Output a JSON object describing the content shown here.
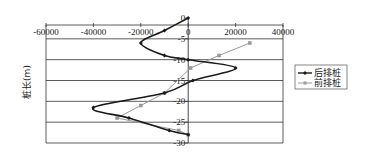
{
  "chart_data": {
    "type": "line",
    "title": "",
    "xlabel": "",
    "ylabel": "桩长(m)",
    "xlim": [
      -60000,
      40000
    ],
    "ylim": [
      -30,
      0
    ],
    "xticks": [
      -60000,
      -40000,
      -20000,
      0,
      20000,
      40000
    ],
    "xtick_labels": [
      "-60000",
      "-40000",
      "-20000",
      "0",
      "20000",
      "40000"
    ],
    "yticks": [
      0,
      -5,
      -10,
      -15,
      -20,
      -25,
      -30
    ],
    "ytick_labels": [
      "0",
      "-5",
      "-10",
      "-15",
      "-20",
      "-25",
      "-30"
    ],
    "grid": "horizontal",
    "legend_position": "right",
    "series": [
      {
        "name": "后排桩",
        "color": "#1a1a1a",
        "marker": "diamond",
        "smooth": true,
        "points": [
          [
            0,
            0
          ],
          [
            -10000,
            -3
          ],
          [
            -20000,
            -6
          ],
          [
            -10000,
            -9
          ],
          [
            0,
            -10
          ],
          [
            20000,
            -12
          ],
          [
            2000,
            -15
          ],
          [
            -10000,
            -18
          ],
          [
            -40000,
            -21.5
          ],
          [
            -25000,
            -24
          ],
          [
            -8000,
            -27
          ],
          [
            0,
            -28
          ]
        ]
      },
      {
        "name": "前排桩",
        "color": "#999999",
        "marker": "square",
        "smooth": false,
        "points": [
          [
            26000,
            -6
          ],
          [
            13000,
            -9
          ],
          [
            1000,
            -12
          ],
          [
            -10000,
            -18
          ],
          [
            -20000,
            -21
          ],
          [
            -30000,
            -24
          ],
          [
            -4000,
            -27
          ],
          [
            0,
            -28
          ]
        ]
      }
    ]
  }
}
